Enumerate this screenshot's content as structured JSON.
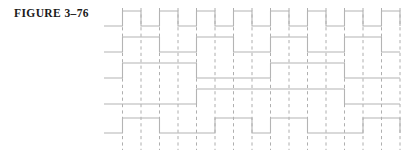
{
  "figure": {
    "label": "FIGURE 3–76"
  },
  "colors": {
    "background": "#ffffff",
    "waveform": "#b4b4b4",
    "gridline": "#9a9a9a",
    "label_text": "#1a1a1a"
  },
  "chart_data": {
    "type": "line",
    "title": "FIGURE 3–76",
    "xlabel": "",
    "ylabel": "",
    "grid": true,
    "legend_position": "none",
    "x": [
      0,
      1,
      2,
      3,
      4,
      5,
      6,
      7,
      8,
      9,
      10,
      11,
      12,
      13,
      14,
      15,
      16
    ],
    "xlim": [
      0,
      16
    ],
    "ylim": [
      0,
      1
    ],
    "time_unit": "clock half-period",
    "series": [
      {
        "name": "CLK",
        "row": 0,
        "values": [
          0,
          1,
          0,
          1,
          0,
          1,
          0,
          1,
          0,
          1,
          0,
          1,
          0,
          1,
          0,
          1,
          0
        ]
      },
      {
        "name": "Q0",
        "row": 1,
        "values": [
          0,
          1,
          1,
          0,
          0,
          1,
          1,
          0,
          0,
          1,
          1,
          0,
          0,
          1,
          1,
          0,
          0
        ]
      },
      {
        "name": "Q1",
        "row": 2,
        "values": [
          0,
          1,
          1,
          1,
          1,
          0,
          0,
          0,
          0,
          1,
          1,
          1,
          1,
          0,
          0,
          0,
          0
        ]
      },
      {
        "name": "Q2",
        "row": 3,
        "values": [
          0,
          0,
          0,
          0,
          0,
          1,
          1,
          1,
          1,
          1,
          1,
          1,
          1,
          0,
          0,
          0,
          0
        ]
      },
      {
        "name": "Q3",
        "row": 4,
        "values": [
          0,
          1,
          1,
          0,
          0,
          0,
          1,
          1,
          0,
          1,
          1,
          0,
          0,
          0,
          1,
          1,
          0
        ]
      }
    ],
    "gridline_positions": [
      1,
      2,
      3,
      4,
      5,
      6,
      7,
      8,
      9,
      10,
      11,
      12,
      13,
      14,
      15,
      16
    ]
  }
}
